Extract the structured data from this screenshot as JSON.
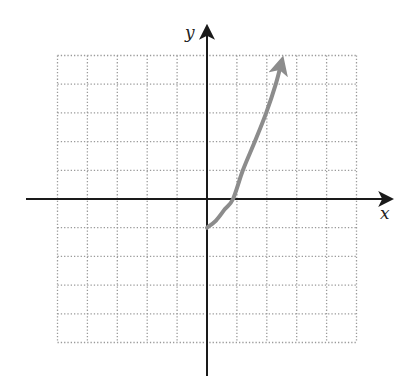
{
  "chart_data": {
    "type": "line",
    "title": "",
    "xlabel": "x",
    "ylabel": "y",
    "grid": true,
    "grid_style": "dotted",
    "xlim": [
      -5,
      5
    ],
    "ylim": [
      -5,
      5
    ],
    "x_ticks_labeled": false,
    "y_ticks_labeled": false,
    "series": [
      {
        "name": "curve",
        "color": "#8c8c8c",
        "start_point": "closed-endpoint-at-origin-side",
        "end_arrow": true,
        "points": [
          [
            0,
            -1
          ],
          [
            0.3,
            -0.75
          ],
          [
            0.6,
            -0.35
          ],
          [
            0.87,
            0
          ],
          [
            1.2,
            1.0
          ],
          [
            1.6,
            2.0
          ],
          [
            1.98,
            3.0
          ],
          [
            2.3,
            4.0
          ],
          [
            2.5,
            4.8
          ]
        ]
      }
    ]
  },
  "labels": {
    "x_axis": "x",
    "y_axis": "y"
  },
  "colors": {
    "axis": "#1a1a1a",
    "grid": "#9a9a9a",
    "curve": "#8c8c8c"
  }
}
